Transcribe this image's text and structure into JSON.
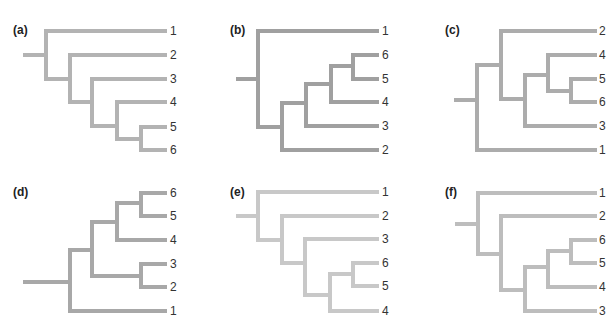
{
  "figure": {
    "caption_fragment": ""
  },
  "panels": [
    {
      "id": "a",
      "label": "(a)",
      "color": "#b3b3b3",
      "newick": "(1,(2,(3,(4,(5,6)))));",
      "leaves": [
        {
          "name": "1",
          "y": 31
        },
        {
          "name": "2",
          "y": 55
        },
        {
          "name": "3",
          "y": 79
        },
        {
          "name": "4",
          "y": 102
        },
        {
          "name": "5",
          "y": 127
        },
        {
          "name": "6",
          "y": 150
        }
      ]
    },
    {
      "id": "b",
      "label": "(b)",
      "color": "#a0a0a0",
      "newick": "(1,(((((6,5),4),3),2));",
      "leaves": [
        {
          "name": "1",
          "y": 31
        },
        {
          "name": "6",
          "y": 55
        },
        {
          "name": "5",
          "y": 79
        },
        {
          "name": "4",
          "y": 102
        },
        {
          "name": "3",
          "y": 126
        },
        {
          "name": "2",
          "y": 150
        }
      ]
    },
    {
      "id": "c",
      "label": "(c)",
      "color": "#acacac",
      "newick": "((2,((4,(5,6)),3)),1);",
      "leaves": [
        {
          "name": "2",
          "y": 31
        },
        {
          "name": "4",
          "y": 55
        },
        {
          "name": "5",
          "y": 79
        },
        {
          "name": "6",
          "y": 102
        },
        {
          "name": "3",
          "y": 126
        },
        {
          "name": "1",
          "y": 150
        }
      ]
    },
    {
      "id": "d",
      "label": "(d)",
      "color": "#a8a8a8",
      "newick": "((((6,5),4),(3,2)),1);",
      "leaves": [
        {
          "name": "6",
          "y": 193
        },
        {
          "name": "5",
          "y": 216
        },
        {
          "name": "4",
          "y": 240
        },
        {
          "name": "3",
          "y": 264
        },
        {
          "name": "2",
          "y": 287
        },
        {
          "name": "1",
          "y": 311
        }
      ]
    },
    {
      "id": "e",
      "label": "(e)",
      "color": "#c8c8c8",
      "newick": "(1,(2,(3,((6,5),4))));",
      "leaves": [
        {
          "name": "1",
          "y": 191
        },
        {
          "name": "2",
          "y": 215
        },
        {
          "name": "3",
          "y": 239
        },
        {
          "name": "6",
          "y": 262
        },
        {
          "name": "5",
          "y": 286
        },
        {
          "name": "4",
          "y": 310
        }
      ]
    },
    {
      "id": "f",
      "label": "(f)",
      "color": "#bdbdbd",
      "newick": "(1,(2,(((6,5),4),3)));",
      "leaves": [
        {
          "name": "1",
          "y": 193
        },
        {
          "name": "2",
          "y": 216
        },
        {
          "name": "6",
          "y": 240
        },
        {
          "name": "5",
          "y": 263
        },
        {
          "name": "4",
          "y": 287
        },
        {
          "name": "3",
          "y": 311
        }
      ]
    }
  ]
}
